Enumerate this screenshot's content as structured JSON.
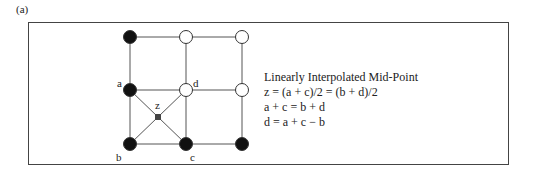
{
  "panel_label": "(a)",
  "grid": {
    "columns_x": [
      130,
      186,
      242
    ],
    "rows_y": [
      37,
      90,
      144
    ],
    "nodes": [
      {
        "col": 0,
        "row": 0,
        "fill": "black"
      },
      {
        "col": 1,
        "row": 0,
        "fill": "white"
      },
      {
        "col": 2,
        "row": 0,
        "fill": "white"
      },
      {
        "col": 0,
        "row": 1,
        "fill": "black",
        "label": "a"
      },
      {
        "col": 1,
        "row": 1,
        "fill": "white",
        "label": "d"
      },
      {
        "col": 2,
        "row": 1,
        "fill": "white"
      },
      {
        "col": 0,
        "row": 2,
        "fill": "black",
        "label": "b"
      },
      {
        "col": 1,
        "row": 2,
        "fill": "black",
        "label": "c"
      },
      {
        "col": 2,
        "row": 2,
        "fill": "black"
      }
    ],
    "midpoint": {
      "label": "z",
      "x": 158,
      "y": 117
    }
  },
  "node_labels": {
    "a": "a",
    "b": "b",
    "c": "c",
    "d": "d",
    "z": "z"
  },
  "equations": {
    "title": "Linearly Interpolated Mid-Point",
    "lines": [
      "z = (a + c)/2 = (b + d)/2",
      "a + c = b + d",
      "d = a + c − b"
    ]
  }
}
